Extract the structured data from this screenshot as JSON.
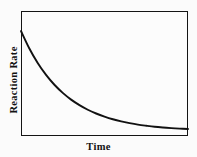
{
  "figure": {
    "background_color": "#fbfbfb",
    "frame_color": "#141414",
    "curve_color": "#111111"
  },
  "chart_data": {
    "type": "line",
    "title": "",
    "subtitle": "",
    "xlabel": "Time",
    "ylabel": "Reaction Rate",
    "xlim": [
      0,
      1
    ],
    "ylim": [
      0,
      1
    ],
    "grid": false,
    "legend": null,
    "xticks": [],
    "yticks": [],
    "xticklabels": [],
    "yticklabels": [],
    "annotations": [],
    "series": [
      {
        "name": "Reaction Rate",
        "color": "#111111",
        "x": [
          0.0,
          0.05,
          0.1,
          0.15,
          0.2,
          0.25,
          0.3,
          0.35,
          0.4,
          0.45,
          0.5,
          0.55,
          0.6,
          0.65,
          0.7,
          0.75,
          0.8,
          0.85,
          0.9,
          0.95,
          1.0
        ],
        "y": [
          0.84,
          0.7,
          0.584,
          0.489,
          0.41,
          0.345,
          0.291,
          0.247,
          0.21,
          0.18,
          0.155,
          0.134,
          0.117,
          0.103,
          0.091,
          0.082,
          0.074,
          0.068,
          0.063,
          0.059,
          0.056
        ]
      }
    ]
  }
}
